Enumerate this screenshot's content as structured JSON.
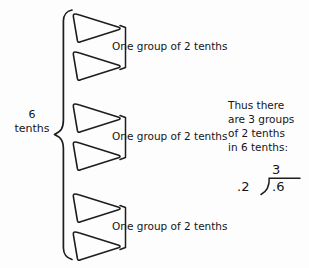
{
  "diagram": {
    "type": "math-instructional-diagram",
    "topic": "division of decimals: 6 tenths divided by 2 tenths",
    "background_color": "#fdfdfd",
    "ink_color": "#151515",
    "left_label": {
      "number": "6",
      "unit": "tenths"
    },
    "groups": [
      {
        "id": "group-1",
        "label": "One group of 2 tenths",
        "shapes": 2,
        "shape_name": "triangle-right"
      },
      {
        "id": "group-2",
        "label": "One group of 2 tenths",
        "shapes": 2,
        "shape_name": "triangle-right"
      },
      {
        "id": "group-3",
        "label": "One group of 2 tenths",
        "shapes": 2,
        "shape_name": "triangle-right"
      }
    ],
    "conclusion": {
      "line1": "Thus there",
      "line2": "are 3 groups",
      "line3": "of 2 tenths",
      "line4": "in 6 tenths:"
    },
    "long_division": {
      "quotient": "3",
      "divisor": ".2",
      "dividend": ".6"
    }
  }
}
